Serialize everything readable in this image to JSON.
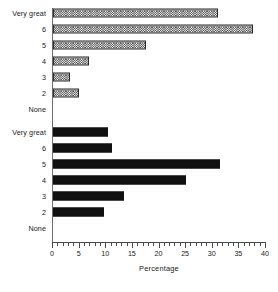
{
  "chart_data": {
    "type": "bar",
    "orientation": "horizontal",
    "title": "",
    "xlabel": "Percentage",
    "ylabel": "",
    "xlim": [
      0,
      40
    ],
    "xticks": [
      0,
      5,
      10,
      15,
      20,
      25,
      30,
      35,
      40
    ],
    "xtick_labels": [
      "0",
      "5",
      "10",
      "15",
      "20",
      "25",
      "30",
      "35",
      "40"
    ],
    "minor_tick_step": 1,
    "grid": false,
    "legend": null,
    "categories": [
      "Very great",
      "6",
      "5",
      "4",
      "3",
      "2",
      "None"
    ],
    "series": [
      {
        "name": "group-a",
        "fill": "hatched",
        "values": [
          31.0,
          37.5,
          17.4,
          6.7,
          3.2,
          4.8,
          0
        ]
      },
      {
        "name": "group-b",
        "fill": "solid",
        "values": [
          10.3,
          11.0,
          31.4,
          24.9,
          13.3,
          9.5,
          0
        ]
      }
    ]
  },
  "chart": {
    "axis_title": "Percentage",
    "groups": [
      {
        "id": "group-a",
        "fill_style": "hatch",
        "rows": [
          {
            "label": "Very great",
            "value": 31.0
          },
          {
            "label": "6",
            "value": 37.5
          },
          {
            "label": "5",
            "value": 17.4
          },
          {
            "label": "4",
            "value": 6.7
          },
          {
            "label": "3",
            "value": 3.2
          },
          {
            "label": "2",
            "value": 4.8
          },
          {
            "label": "None",
            "value": 0
          }
        ]
      },
      {
        "id": "group-b",
        "fill_style": "solid",
        "rows": [
          {
            "label": "Very great",
            "value": 10.3
          },
          {
            "label": "6",
            "value": 11.0
          },
          {
            "label": "5",
            "value": 31.4
          },
          {
            "label": "4",
            "value": 24.9
          },
          {
            "label": "3",
            "value": 13.3
          },
          {
            "label": "2",
            "value": 9.5
          },
          {
            "label": "None",
            "value": 0
          }
        ]
      }
    ],
    "ticks": [
      {
        "value": 0,
        "label": "0"
      },
      {
        "value": 5,
        "label": "5"
      },
      {
        "value": 10,
        "label": "10"
      },
      {
        "value": 15,
        "label": "15"
      },
      {
        "value": 20,
        "label": "20"
      },
      {
        "value": 25,
        "label": "25"
      },
      {
        "value": 30,
        "label": "30"
      },
      {
        "value": 35,
        "label": "35"
      },
      {
        "value": 40,
        "label": "40"
      }
    ],
    "colors": {
      "hatch_ink": "#4a4a4a",
      "solid_fill": "#111111",
      "axis": "#4a4a4a",
      "text": "#1a1a1a",
      "background": "#ffffff"
    }
  }
}
